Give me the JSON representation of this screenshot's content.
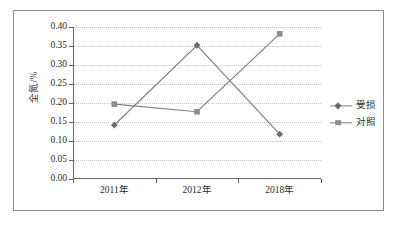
{
  "chart_data": {
    "type": "line",
    "title": "",
    "subtitle": "",
    "xlabel": "",
    "ylabel": "全氮/%",
    "categories": [
      "2011年",
      "2012年",
      "2018年"
    ],
    "series": [
      {
        "name": "受损",
        "marker": "diamond",
        "color": "#6d6d6d",
        "values": [
          0.142,
          0.352,
          0.118
        ]
      },
      {
        "name": "对照",
        "marker": "square",
        "color": "#8c8c8c",
        "values": [
          0.197,
          0.177,
          0.382
        ]
      }
    ],
    "ylim": [
      0.0,
      0.4
    ],
    "ytick_step": 0.05,
    "ytick_labels": [
      "0.00",
      "0.05",
      "0.10",
      "0.15",
      "0.20",
      "0.25",
      "0.30",
      "0.35",
      "0.40"
    ],
    "grid": true,
    "grid_style": "dotted",
    "legend_position": "right",
    "frame": true
  },
  "legend": {
    "entries": [
      {
        "label": "受损",
        "marker": "diamond-marker"
      },
      {
        "label": "对照",
        "marker": "square-marker"
      }
    ]
  },
  "colors": {
    "axis": "#666666",
    "grid": "#c4c4c4",
    "frame": "#8a8a8a",
    "text": "#2b2b2b",
    "series_damaged": "#6d6d6d",
    "series_control": "#8c8c8c",
    "line": "#808080"
  }
}
